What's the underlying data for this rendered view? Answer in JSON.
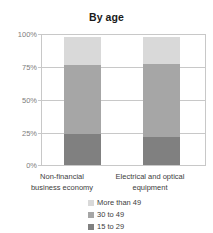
{
  "chart_data": {
    "type": "bar",
    "subtype": "stacked-percentage-column",
    "title": "By age",
    "xlabel": "",
    "ylabel": "",
    "ylim": [
      0,
      100
    ],
    "ytick_labels": [
      "100%",
      "75%",
      "50%",
      "25%",
      "0%"
    ],
    "ytick_values": [
      100,
      75,
      50,
      25,
      0
    ],
    "grid": true,
    "legend_position": "bottom-right",
    "categories": [
      "Non-financial business economy",
      "Electrical and optical equipment"
    ],
    "category_lines": [
      [
        "Non-financial",
        "business economy"
      ],
      [
        "Electrical and optical",
        "equipment"
      ]
    ],
    "series": [
      {
        "name": "More than 49",
        "color": "#d9d9d9",
        "values": [
          22,
          21
        ]
      },
      {
        "name": "30 to 49",
        "color": "#a6a6a6",
        "values": [
          54,
          57
        ]
      },
      {
        "name": "15 to 29",
        "color": "#808080",
        "values": [
          24,
          22
        ]
      }
    ],
    "stack_order_bottom_to_top": [
      "15 to 29",
      "30 to 49",
      "More than 49"
    ]
  },
  "colors": {
    "background": "#ffffff",
    "grid": "#c8c8c8",
    "axis_text": "#7d7d7d",
    "label_text": "#3d3d3d",
    "title_text": "#1a1a1a",
    "more_than_49": "#d9d9d9",
    "age_30_to_49": "#a6a6a6",
    "age_15_to_29": "#808080"
  }
}
